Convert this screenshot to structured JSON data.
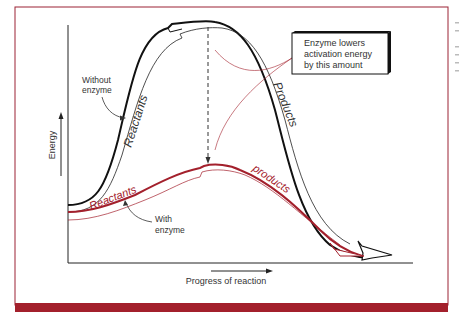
{
  "figure": {
    "y_axis_label": "Energy",
    "x_axis_label": "Progress of reaction",
    "callout": {
      "line1": "Enzyme lowers",
      "line2": "activation energy",
      "line3": "by this amount"
    },
    "without_enzyme": {
      "label_line1": "Without",
      "label_line2": "enzyme",
      "reactants": "Reactants",
      "products": "Products"
    },
    "with_enzyme": {
      "label_line1": "With",
      "label_line2": "enzyme",
      "reactants": "Reactants",
      "products": "products"
    },
    "colors": {
      "frame": "#9b2335",
      "bar": "#a3202c",
      "uncatalyzed": "#111111",
      "catalyzed": "#a3202c"
    }
  }
}
